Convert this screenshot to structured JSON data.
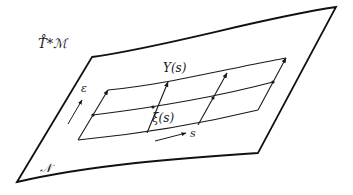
{
  "figure": {
    "labels": {
      "ambient_space": "T̊*ℳ",
      "surface": "𝒩",
      "top_curve": "Y(s)",
      "middle_curve": "ξ(s)",
      "epsilon_direction": "ε",
      "s_direction": "s"
    },
    "colors": {
      "background": "#ffffff",
      "stroke": "#111111"
    }
  }
}
